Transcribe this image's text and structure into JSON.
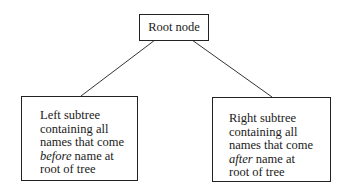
{
  "diagram": {
    "type": "binary-tree",
    "root": {
      "label": "Root node"
    },
    "left": {
      "lines": [
        "Left subtree",
        "containing all",
        "names that come"
      ],
      "emph_word": "before",
      "after_emph": " name at",
      "last_line": "root of tree"
    },
    "right": {
      "lines": [
        "Right subtree",
        "containing all",
        "names that come"
      ],
      "emph_word": "after",
      "after_emph": " name at",
      "last_line": "root of tree"
    },
    "edges": [
      {
        "from": "root",
        "to": "left"
      },
      {
        "from": "root",
        "to": "right"
      }
    ]
  }
}
